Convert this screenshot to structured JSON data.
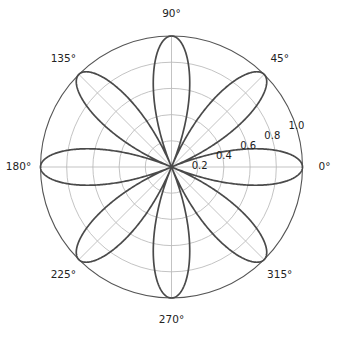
{
  "figure": {
    "kind": "polar-plot",
    "background_color": "#ffffff",
    "width": 342,
    "height": 337
  },
  "chart_data": {
    "type": "line",
    "projection": "polar",
    "title": "",
    "xlabel": "",
    "ylabel": "",
    "grid": true,
    "legend": null,
    "curve_color": "#4a4a4a",
    "grid_color": "#b8b8b8",
    "spine_color": "#555555",
    "rlim": [
      0,
      1.0
    ],
    "thetalim_deg": [
      0,
      360
    ],
    "theta_direction": "counterclockwise",
    "theta_zero_location": "E",
    "theta_tick_labels": [
      "0°",
      "45°",
      "90°",
      "135°",
      "180°",
      "225°",
      "270°",
      "315°"
    ],
    "theta_tick_values_deg": [
      0,
      45,
      90,
      135,
      180,
      225,
      270,
      315
    ],
    "r_tick_labels": [
      "0.2",
      "0.4",
      "0.6",
      "0.8",
      "1.0"
    ],
    "r_tick_values": [
      0.2,
      0.4,
      0.6,
      0.8,
      1.0
    ],
    "r_label_angle_deg": 22.5,
    "series": [
      {
        "name": "rose",
        "equation": "r = |cos(4*theta)|",
        "petal_count": 8,
        "petal_peak_angles_deg": [
          22.5,
          67.5,
          112.5,
          157.5,
          202.5,
          247.5,
          292.5,
          337.5
        ],
        "petal_peak_radius": 1.0,
        "sample_theta_deg": [
          0,
          11.25,
          22.5,
          33.75,
          45,
          56.25,
          67.5,
          78.75,
          90,
          101.25,
          112.5,
          123.75,
          135,
          146.25,
          157.5,
          168.75,
          180,
          191.25,
          202.5,
          213.75,
          225,
          236.25,
          247.5,
          258.75,
          270,
          281.25,
          292.5,
          303.75,
          315,
          326.25,
          337.5,
          348.75,
          360
        ],
        "sample_r": [
          1.0,
          0.707,
          0.0,
          0.707,
          1.0,
          0.707,
          0.0,
          0.707,
          1.0,
          0.707,
          0.0,
          0.707,
          1.0,
          0.707,
          0.0,
          0.707,
          1.0,
          0.707,
          0.0,
          0.707,
          1.0,
          0.707,
          0.0,
          0.707,
          1.0,
          0.707,
          0.0,
          0.707,
          1.0,
          0.707,
          0.0,
          0.707,
          1.0
        ]
      }
    ]
  }
}
